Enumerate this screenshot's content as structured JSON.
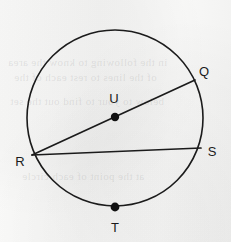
{
  "figure": {
    "background_color": "#f5f5f4",
    "stroke_color": "#1b1b1b",
    "width": 231,
    "height": 242
  },
  "circle": {
    "name": "circle-U",
    "center_x": 115,
    "center_y": 118,
    "radius": 88,
    "stroke_width": 1.6
  },
  "points": {
    "Q": {
      "label": "Q",
      "x": 195,
      "y": 80,
      "label_x": 204,
      "label_y": 71,
      "dot": false
    },
    "R": {
      "label": "R",
      "x": 32,
      "y": 155,
      "label_x": 20,
      "label_y": 161,
      "dot": false
    },
    "S": {
      "label": "S",
      "x": 201,
      "y": 148,
      "label_x": 212,
      "label_y": 151,
      "dot": false
    },
    "T": {
      "label": "T",
      "x": 115,
      "y": 207,
      "label_x": 115,
      "label_y": 227,
      "dot": true
    },
    "U": {
      "label": "U",
      "x": 115,
      "y": 117,
      "label_x": 114,
      "label_y": 98,
      "dot": true
    }
  },
  "dots": {
    "center_dot_radius": 4.2,
    "point_dot_radius": 4.4,
    "fill": "#111111"
  },
  "segments": [
    {
      "name": "chord-R-Q",
      "from": "R",
      "to": "Q",
      "x1": 32,
      "y1": 155,
      "x2": 195,
      "y2": 80,
      "stroke_width": 1.7
    },
    {
      "name": "chord-R-S",
      "from": "R",
      "to": "S",
      "x1": 32,
      "y1": 155,
      "x2": 201,
      "y2": 148,
      "stroke_width": 1.7
    }
  ],
  "ghost_text": [
    {
      "text": "in the following to know the area",
      "x": 8,
      "y": 62,
      "size": 11
    },
    {
      "text": "of the lines to rest each of the",
      "x": 14,
      "y": 77,
      "size": 11
    },
    {
      "text": "below to your to find out the set",
      "x": 10,
      "y": 101,
      "size": 11
    },
    {
      "text": "at the point of each circle",
      "x": 22,
      "y": 176,
      "size": 11
    }
  ]
}
